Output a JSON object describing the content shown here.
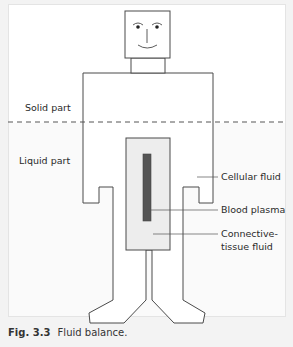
{
  "diagram": {
    "labels": {
      "solid_part": "Solid part",
      "liquid_part": "Liquid part",
      "cellular_fluid": "Cellular fluid",
      "blood_plasma": "Blood plasma",
      "connective_line1": "Connective-",
      "connective_line2": "tissue fluid"
    },
    "colors": {
      "outline": "#4a4a4a",
      "liquid_fill": "#f2f2f2",
      "inner_fill": "#ececec",
      "plasma_fill": "#555555",
      "dashed_line": "#555555"
    }
  },
  "caption": {
    "figure_number": "Fig. 3.3",
    "text": "Fluid balance."
  }
}
